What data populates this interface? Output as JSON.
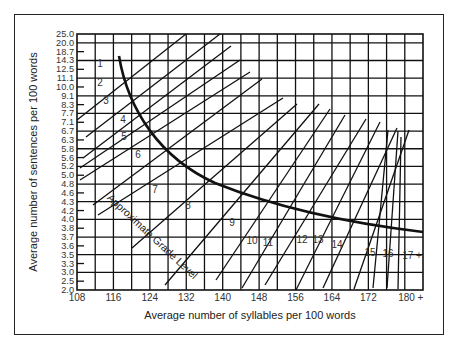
{
  "chart_data": {
    "type": "line",
    "title": "",
    "xlabel": "Average number of syllables per 100 words",
    "ylabel": "Average number of sentences per 100 words",
    "x_ticks": [
      "108",
      "116",
      "124",
      "132",
      "140",
      "148",
      "156",
      "164",
      "172",
      "180 +"
    ],
    "y_ticks": [
      "25.0",
      "20.0",
      "18.7",
      "14.3",
      "12.5",
      "11.1",
      "10.0",
      "9.1",
      "8.3",
      "7.7",
      "7.1",
      "6.7",
      "6.3",
      "5.8",
      "5.6",
      "5.2",
      "5.0",
      "4.8",
      "4.6",
      "4.3",
      "4.2",
      "4.0",
      "3.8",
      "3.7",
      "3.6",
      "3.5",
      "3.3",
      "3.0",
      "2.5",
      "2.0"
    ],
    "xlim": [
      108,
      184
    ],
    "grid": true,
    "curve_label": "Approximate Grade Level",
    "grade_levels": [
      "1",
      "2",
      "3",
      "4",
      "5",
      "6",
      "7",
      "8",
      "9",
      "10",
      "11",
      "12",
      "13",
      "14",
      "15",
      "16",
      "17 +"
    ],
    "series": [
      {
        "name": "Grade boundary curve",
        "points": [
          [
            110,
            25.0
          ],
          [
            112,
            11.1
          ],
          [
            116,
            8.3
          ],
          [
            124,
            6.3
          ],
          [
            132,
            5.5
          ],
          [
            140,
            5.0
          ],
          [
            148,
            4.6
          ],
          [
            156,
            4.3
          ],
          [
            164,
            4.1
          ],
          [
            172,
            3.95
          ],
          [
            180,
            3.85
          ],
          [
            184,
            3.8
          ]
        ]
      }
    ]
  },
  "labels": {
    "x_title": "Average number of syllables per 100 words",
    "y_title": "Average number of sentences per 100 words",
    "curve_label": "Approximate Grade Level"
  }
}
